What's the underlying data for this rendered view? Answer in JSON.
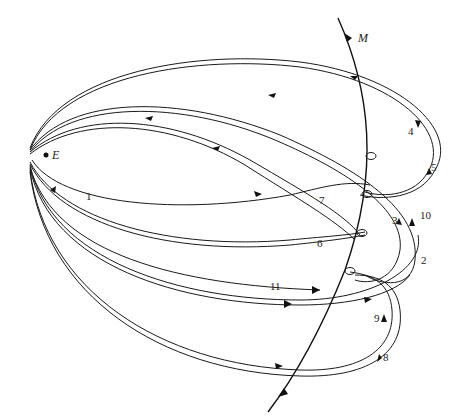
{
  "diagram": {
    "earth_label": "E",
    "moon_orbit_label": "M",
    "trajectory_labels": [
      "1",
      "2",
      "3",
      "4",
      "5",
      "6",
      "7",
      "8",
      "9",
      "10",
      "11"
    ],
    "colors": {
      "ink": "#1a1a1a",
      "background": "#ffffff"
    }
  }
}
